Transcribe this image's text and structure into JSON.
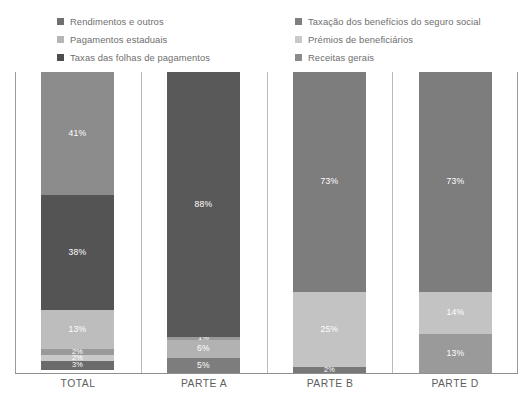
{
  "legend": {
    "columns": [
      {
        "name": "legend-column-left",
        "items": [
          {
            "label": "Rendimentos e outros",
            "color": "#6f6f6f",
            "swatch_icon": "square-swatch-icon"
          },
          {
            "label": "Pagamentos estaduais",
            "color": "#b6b6b6",
            "swatch_icon": "square-swatch-icon"
          },
          {
            "label": "Taxas das folhas de pagamentos",
            "color": "#4e4e4e",
            "swatch_icon": "square-swatch-icon"
          }
        ]
      },
      {
        "name": "legend-column-right",
        "items": [
          {
            "label": "Taxação dos benefícios do seguro social",
            "color": "#7f7f7f",
            "swatch_icon": "square-swatch-icon"
          },
          {
            "label": "Prémios de beneficiários",
            "color": "#c9c9c9",
            "swatch_icon": "square-swatch-icon"
          },
          {
            "label": "Receitas gerais",
            "color": "#8c8c8c",
            "swatch_icon": "square-swatch-icon"
          }
        ]
      }
    ]
  },
  "chart_data": {
    "type": "bar",
    "title": "",
    "subtitle": "",
    "xlabel": "",
    "ylabel": "",
    "stacked": true,
    "stack_total": 100,
    "unit": "%",
    "ylim": [
      0,
      100
    ],
    "grid": false,
    "legend_position": "top",
    "categories": [
      "TOTAL",
      "PARTE A",
      "PARTE B",
      "PARTE D"
    ],
    "series": [
      {
        "name": "Rendimentos e outros",
        "color": "#8c8c8c",
        "values": [
          41,
          88,
          73,
          73
        ]
      },
      {
        "name": "Taxas das folhas de pagamentos",
        "color": "#545454",
        "values": [
          38,
          null,
          null,
          null
        ]
      },
      {
        "name": "Pagamentos estaduais",
        "color": "#bdbdbd",
        "values": [
          13,
          null,
          25,
          14
        ]
      },
      {
        "name": "Taxação dos benefícios do seguro social",
        "color": "#9a9a9a",
        "values": [
          2,
          1,
          null,
          13
        ]
      },
      {
        "name": "Prémios de beneficiários",
        "color": "#c9c9c9",
        "values": [
          2,
          6,
          null,
          null
        ]
      },
      {
        "name": "Receitas gerais",
        "color": "#6b6b6b",
        "values": [
          3,
          5,
          2,
          null
        ]
      }
    ],
    "bars": [
      {
        "category": "TOTAL",
        "segments": [
          {
            "label": "41%",
            "value": 41,
            "color": "#8c8c8c",
            "series": "Rendimentos e outros"
          },
          {
            "label": "38%",
            "value": 38,
            "color": "#545454",
            "series": "Taxas das folhas de pagamentos"
          },
          {
            "label": "13%",
            "value": 13,
            "color": "#bdbdbd",
            "series": "Pagamentos estaduais"
          },
          {
            "label": "2%",
            "value": 2,
            "color": "#9a9a9a",
            "series": "Taxação dos benefícios do seguro social"
          },
          {
            "label": "2%",
            "value": 2,
            "color": "#c9c9c9",
            "series": "Prémios de beneficiários"
          },
          {
            "label": "3%",
            "value": 3,
            "color": "#6b6b6b",
            "series": "Receitas gerais"
          }
        ]
      },
      {
        "category": "PARTE A",
        "segments": [
          {
            "label": "88%",
            "value": 88,
            "color": "#595959",
            "series": "Rendimentos e outros"
          },
          {
            "label": "1%",
            "value": 1,
            "color": "#9a9a9a",
            "series": "Taxação dos benefícios do seguro social"
          },
          {
            "label": "6%",
            "value": 6,
            "color": "#b2b2b2",
            "series": "Prémios de beneficiários"
          },
          {
            "label": "5%",
            "value": 5,
            "color": "#7d7d7d",
            "series": "Receitas gerais"
          }
        ]
      },
      {
        "category": "PARTE B",
        "segments": [
          {
            "label": "73%",
            "value": 73,
            "color": "#7d7d7d",
            "series": "Rendimentos e outros"
          },
          {
            "label": "25%",
            "value": 25,
            "color": "#c3c3c3",
            "series": "Pagamentos estaduais"
          },
          {
            "label": "2%",
            "value": 2,
            "color": "#787878",
            "series": "Receitas gerais"
          }
        ]
      },
      {
        "category": "PARTE D",
        "segments": [
          {
            "label": "73%",
            "value": 73,
            "color": "#7d7d7d",
            "series": "Rendimentos e outros"
          },
          {
            "label": "14%",
            "value": 14,
            "color": "#c3c3c3",
            "series": "Pagamentos estaduais"
          },
          {
            "label": "13%",
            "value": 13,
            "color": "#9a9a9a",
            "series": "Taxação dos benefícios do seguro social"
          }
        ]
      }
    ]
  },
  "axis": {
    "left_line_color": "#9a9a9a",
    "right_line_color": "#9a9a9a",
    "bottom_line_color": "#8f8f8f",
    "separator_color": "#b9b9b9"
  }
}
